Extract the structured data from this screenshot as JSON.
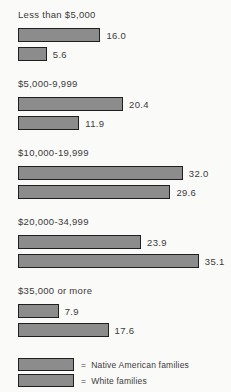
{
  "chart_data": {
    "type": "bar",
    "orientation": "horizontal",
    "title": "",
    "categories": [
      "Less than $5,000",
      "$5,000-9,999",
      "$10,000-19,999",
      "$20,000-34,999",
      "$35,000 or more"
    ],
    "series": [
      {
        "name": "Native American families",
        "values": [
          16.0,
          20.4,
          32.0,
          23.9,
          7.9
        ],
        "labels": [
          "16.0",
          "20.4",
          "32.0",
          "23.9",
          "7.9"
        ]
      },
      {
        "name": "White families",
        "values": [
          5.6,
          11.9,
          29.6,
          35.1,
          17.6
        ],
        "labels": [
          "5.6",
          "11.9",
          "29.6",
          "35.1",
          "17.6"
        ]
      }
    ],
    "xlim": [
      0,
      38
    ],
    "value_labels_shown": true,
    "grid": false,
    "legend_position": "bottom",
    "bar_color": "#8c8c8c",
    "bar_border_color": "#1f1f1f"
  },
  "legend": {
    "items": [
      {
        "prefix": "=",
        "label": "Native American families"
      },
      {
        "prefix": "=",
        "label": "White families"
      }
    ]
  }
}
